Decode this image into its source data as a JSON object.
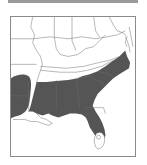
{
  "map": {
    "title": "",
    "region": "Southeastern United States",
    "range_fill_color": "#555555",
    "border_color": "#6e6e6e",
    "background_color": "#ffffff",
    "frame_color": "#8a8a8a",
    "shaded_states": [
      "Texas (east)",
      "Louisiana",
      "Mississippi",
      "Alabama",
      "Georgia",
      "South Carolina",
      "North Carolina",
      "Virginia (southeast)",
      "Florida"
    ],
    "unshaded_areas": [
      "Florida (southern tip)",
      "Louisiana (coastal delta)"
    ]
  }
}
